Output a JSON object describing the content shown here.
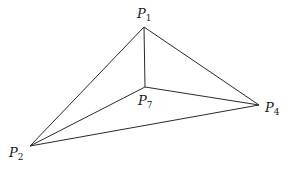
{
  "diagram": {
    "type": "tetrahedron-projection",
    "vertices": [
      {
        "id": "P1",
        "letter": "P",
        "sub": "1",
        "x": 144,
        "y": 27,
        "label_x": 137,
        "label_y": 7
      },
      {
        "id": "P7",
        "letter": "P",
        "sub": "7",
        "x": 145,
        "y": 87,
        "label_x": 138,
        "label_y": 94
      },
      {
        "id": "P4",
        "letter": "P",
        "sub": "4",
        "x": 259,
        "y": 105,
        "label_x": 265,
        "label_y": 101
      },
      {
        "id": "P2",
        "letter": "P",
        "sub": "2",
        "x": 30,
        "y": 146,
        "label_x": 9,
        "label_y": 146
      }
    ],
    "edges": [
      [
        "P1",
        "P2"
      ],
      [
        "P1",
        "P4"
      ],
      [
        "P1",
        "P7"
      ],
      [
        "P7",
        "P2"
      ],
      [
        "P7",
        "P4"
      ],
      [
        "P2",
        "P4"
      ]
    ],
    "colors": {
      "stroke": "#2a2a2a",
      "text": "#1a1a1a",
      "background": "#ffffff"
    }
  },
  "labels": {
    "p1": {
      "letter": "P",
      "sub": "1"
    },
    "p7": {
      "letter": "P",
      "sub": "7"
    },
    "p4": {
      "letter": "P",
      "sub": "4"
    },
    "p2": {
      "letter": "P",
      "sub": "2"
    }
  }
}
